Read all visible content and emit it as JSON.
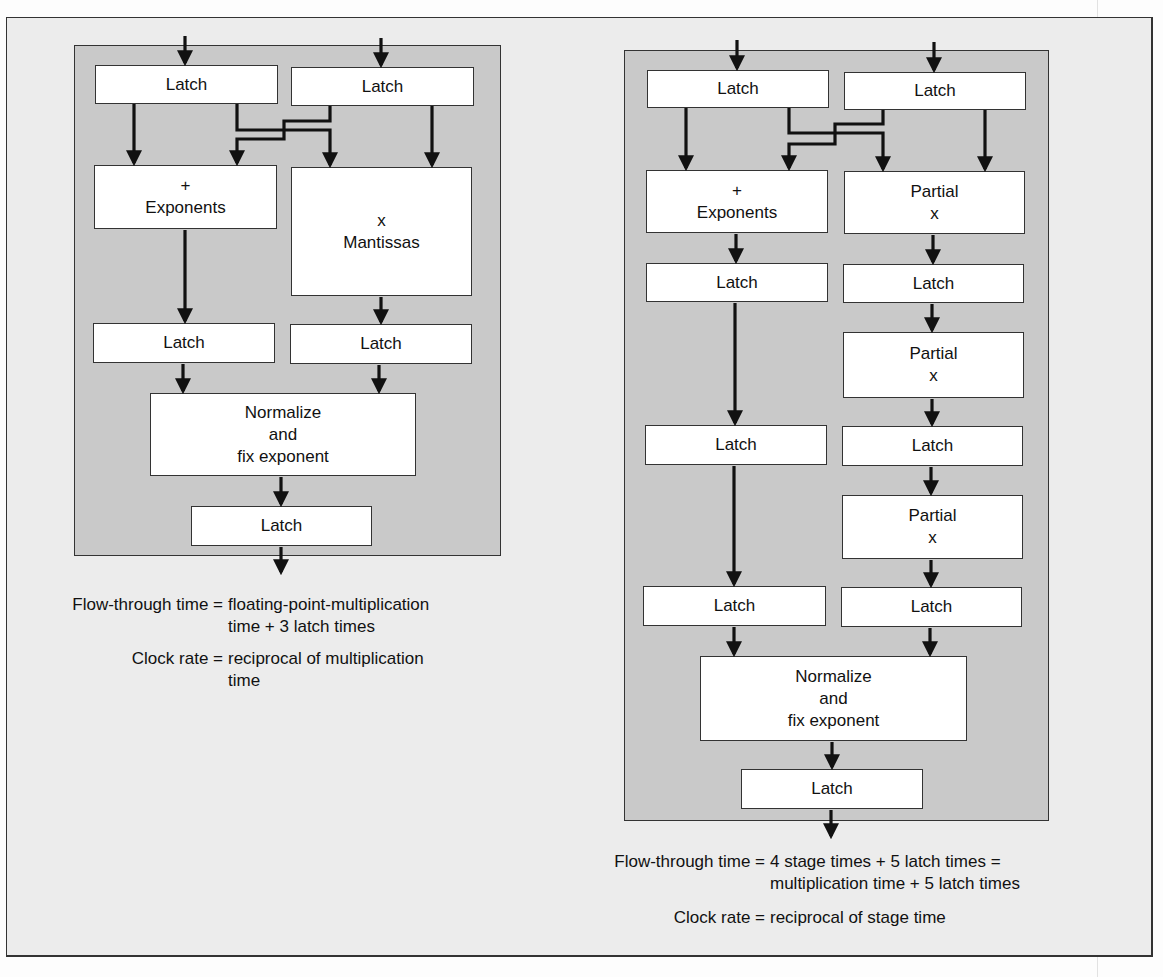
{
  "figure": {
    "top_caption_fragment": "...unit with stages of equal length: floating-point multiplication",
    "colors": {
      "background": "#ececec",
      "panel": "#c9c9c9",
      "box": "#ffffff",
      "stroke": "#111111"
    }
  },
  "left_diagram": {
    "title": "Non-pipelined floating-point multiplier",
    "boxes": {
      "latch_in_a": "Latch",
      "latch_in_b": "Latch",
      "exponents_op": "+",
      "exponents_label": "Exponents",
      "mantissas_op": "x",
      "mantissas_label": "Mantissas",
      "latch_exp": "Latch",
      "latch_mant": "Latch",
      "normalize_l1": "Normalize",
      "normalize_l2": "and",
      "normalize_l3": "fix exponent",
      "latch_out": "Latch"
    },
    "caption": {
      "flow_lhs": "Flow-through time =",
      "flow_rhs_1": "floating-point-multiplication",
      "flow_rhs_2": "time + 3 latch times",
      "clock_lhs": "Clock rate =",
      "clock_rhs_1": "reciprocal of multiplication",
      "clock_rhs_2": "time"
    }
  },
  "right_diagram": {
    "title": "Pipelined floating-point multiplier",
    "boxes": {
      "latch_in_a": "Latch",
      "latch_in_b": "Latch",
      "exponents_op": "+",
      "exponents_label": "Exponents",
      "partial1_label": "Partial",
      "partial1_op": "x",
      "latch_exp_1": "Latch",
      "latch_part_1": "Latch",
      "partial2_label": "Partial",
      "partial2_op": "x",
      "latch_exp_2": "Latch",
      "latch_part_2": "Latch",
      "partial3_label": "Partial",
      "partial3_op": "x",
      "latch_exp_3": "Latch",
      "latch_part_3": "Latch",
      "normalize_l1": "Normalize",
      "normalize_l2": "and",
      "normalize_l3": "fix exponent",
      "latch_out": "Latch"
    },
    "caption": {
      "flow_lhs": "Flow-through time =",
      "flow_rhs_1": "4 stage times + 5 latch times =",
      "flow_rhs_2": "multiplication time + 5 latch times",
      "clock_lhs": "Clock rate =",
      "clock_rhs_1": "reciprocal of stage time"
    }
  }
}
